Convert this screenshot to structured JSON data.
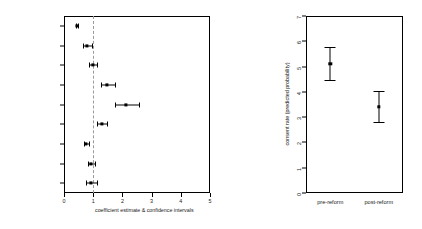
{
  "chart_data": [
    {
      "type": "scatter",
      "panel": "left",
      "title": "",
      "xlabel": "coefficient estimate & confidence intervals",
      "ylabel": "",
      "xlim": [
        0,
        5
      ],
      "xticks": [
        0,
        1,
        2,
        3,
        4,
        5
      ],
      "xtick_labels": [
        "0",
        "1",
        "2",
        "3",
        "4",
        "5"
      ],
      "grid": false,
      "reference_line": 1,
      "reference_line_style": "dashed",
      "orientation": "horizontal",
      "categories": [
        "Reform",
        "Opposition control of BR",
        "Mixed control of BR",
        "International Affairs",
        "Finance",
        "Salient Bill",
        "Long Debate",
        "Unanimous",
        "Recorded Vote"
      ],
      "estimates": [
        0.44,
        0.79,
        0.98,
        1.46,
        2.13,
        1.31,
        0.76,
        0.93,
        0.92
      ],
      "ci_lower": [
        0.4,
        0.65,
        0.85,
        1.25,
        1.76,
        1.13,
        0.68,
        0.83,
        0.76
      ],
      "ci_upper": [
        0.49,
        0.95,
        1.13,
        1.73,
        2.58,
        1.47,
        0.86,
        1.06,
        1.12
      ]
    },
    {
      "type": "scatter",
      "panel": "right",
      "title": "",
      "xlabel": "",
      "ylabel": "consent rate (predicted probability)",
      "ylim": [
        0,
        7
      ],
      "yticks": [
        0,
        1,
        2,
        3,
        4,
        5,
        6,
        7
      ],
      "ytick_labels": [
        "0",
        "1",
        "2",
        "3",
        "4",
        "5",
        "6",
        "7"
      ],
      "grid": false,
      "orientation": "vertical",
      "categories": [
        "pre-reform",
        "post-reform"
      ],
      "estimates": [
        5.1,
        3.42
      ],
      "ci_lower": [
        4.45,
        2.8
      ],
      "ci_upper": [
        5.77,
        4.04
      ]
    }
  ]
}
